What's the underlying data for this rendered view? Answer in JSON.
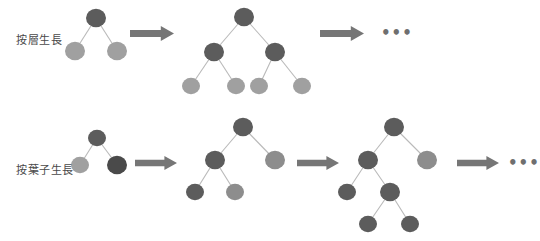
{
  "figure": {
    "title": "",
    "background": "#ffffff"
  },
  "palette": {
    "node_dark": "#5c5c5c",
    "node_mid": "#7d7d7d",
    "node_light": "#a0a0a0",
    "node_highlight": "#4a4a4a",
    "edge": "#b9b9b9",
    "arrow": "#767676",
    "label_text": "#4a4a4a",
    "ellipsis": "#6f6f6f"
  },
  "rows": [
    {
      "id": "level-wise",
      "label": "按層生長",
      "label_x": 16,
      "label_y": 31,
      "arrows": [
        {
          "x": 130,
          "y": 26,
          "w": 44,
          "h": 15
        },
        {
          "x": 320,
          "y": 26,
          "w": 44,
          "h": 15
        }
      ],
      "ellipsis": {
        "text": "•••",
        "x": 381,
        "y": 26
      },
      "trees": [
        {
          "id": "tree-1",
          "nodes": [
            {
              "id": "n0",
              "x": 96,
              "y": 18,
              "r": 10,
              "color": "#5c5c5c"
            },
            {
              "id": "n1",
              "x": 75,
              "y": 51,
              "r": 10,
              "color": "#a0a0a0"
            },
            {
              "id": "n2",
              "x": 117,
              "y": 51,
              "r": 10,
              "color": "#a0a0a0"
            }
          ],
          "edges": [
            [
              "n0",
              "n1"
            ],
            [
              "n0",
              "n2"
            ]
          ]
        },
        {
          "id": "tree-2",
          "nodes": [
            {
              "id": "m0",
              "x": 244,
              "y": 17,
              "r": 10,
              "color": "#5c5c5c"
            },
            {
              "id": "m1",
              "x": 214,
              "y": 52,
              "r": 10,
              "color": "#5c5c5c"
            },
            {
              "id": "m2",
              "x": 275,
              "y": 52,
              "r": 10,
              "color": "#5c5c5c"
            },
            {
              "id": "m11",
              "x": 191,
              "y": 86,
              "r": 9,
              "color": "#a0a0a0"
            },
            {
              "id": "m12",
              "x": 236,
              "y": 86,
              "r": 9,
              "color": "#a0a0a0"
            },
            {
              "id": "m21",
              "x": 259,
              "y": 86,
              "r": 9,
              "color": "#a0a0a0"
            },
            {
              "id": "m22",
              "x": 302,
              "y": 86,
              "r": 9,
              "color": "#a0a0a0"
            }
          ],
          "edges": [
            [
              "m0",
              "m1"
            ],
            [
              "m0",
              "m2"
            ],
            [
              "m1",
              "m11"
            ],
            [
              "m1",
              "m12"
            ],
            [
              "m2",
              "m21"
            ],
            [
              "m2",
              "m22"
            ]
          ]
        }
      ]
    },
    {
      "id": "leaf-wise",
      "label": "按葉子生長",
      "label_x": 16,
      "label_y": 161,
      "arrows": [
        {
          "x": 135,
          "y": 156,
          "w": 42,
          "h": 14
        },
        {
          "x": 297,
          "y": 156,
          "w": 42,
          "h": 14
        },
        {
          "x": 457,
          "y": 156,
          "w": 42,
          "h": 14
        }
      ],
      "ellipsis": {
        "text": "•••",
        "x": 508,
        "y": 156
      },
      "trees": [
        {
          "id": "tree-1",
          "nodes": [
            {
              "id": "a0",
              "x": 97,
              "y": 138,
              "r": 9,
              "color": "#5c5c5c"
            },
            {
              "id": "a1",
              "x": 80,
              "y": 165,
              "r": 9,
              "color": "#a0a0a0"
            },
            {
              "id": "a2",
              "x": 117,
              "y": 165,
              "r": 10,
              "color": "#4a4a4a"
            }
          ],
          "edges": [
            [
              "a0",
              "a1"
            ],
            [
              "a0",
              "a2"
            ]
          ]
        },
        {
          "id": "tree-2",
          "nodes": [
            {
              "id": "b0",
              "x": 243,
              "y": 127,
              "r": 10,
              "color": "#5c5c5c"
            },
            {
              "id": "b1",
              "x": 215,
              "y": 160,
              "r": 10,
              "color": "#5c5c5c"
            },
            {
              "id": "b2",
              "x": 275,
              "y": 160,
              "r": 10,
              "color": "#8d8d8d"
            },
            {
              "id": "b11",
              "x": 195,
              "y": 192,
              "r": 9,
              "color": "#5c5c5c"
            },
            {
              "id": "b12",
              "x": 235,
              "y": 192,
              "r": 9,
              "color": "#8d8d8d"
            }
          ],
          "edges": [
            [
              "b0",
              "b1"
            ],
            [
              "b0",
              "b2"
            ],
            [
              "b1",
              "b11"
            ],
            [
              "b1",
              "b12"
            ]
          ]
        },
        {
          "id": "tree-3",
          "nodes": [
            {
              "id": "c0",
              "x": 394,
              "y": 127,
              "r": 10,
              "color": "#5c5c5c"
            },
            {
              "id": "c1",
              "x": 368,
              "y": 160,
              "r": 10,
              "color": "#5c5c5c"
            },
            {
              "id": "c2",
              "x": 427,
              "y": 160,
              "r": 10,
              "color": "#8d8d8d"
            },
            {
              "id": "c11",
              "x": 347,
              "y": 192,
              "r": 9,
              "color": "#5c5c5c"
            },
            {
              "id": "c12",
              "x": 390,
              "y": 192,
              "r": 10,
              "color": "#5c5c5c"
            },
            {
              "id": "c121",
              "x": 368,
              "y": 224,
              "r": 9,
              "color": "#5c5c5c"
            },
            {
              "id": "c122",
              "x": 410,
              "y": 224,
              "r": 9,
              "color": "#5c5c5c"
            }
          ],
          "edges": [
            [
              "c0",
              "c1"
            ],
            [
              "c0",
              "c2"
            ],
            [
              "c1",
              "c11"
            ],
            [
              "c1",
              "c12"
            ],
            [
              "c12",
              "c121"
            ],
            [
              "c12",
              "c122"
            ]
          ]
        }
      ]
    }
  ]
}
